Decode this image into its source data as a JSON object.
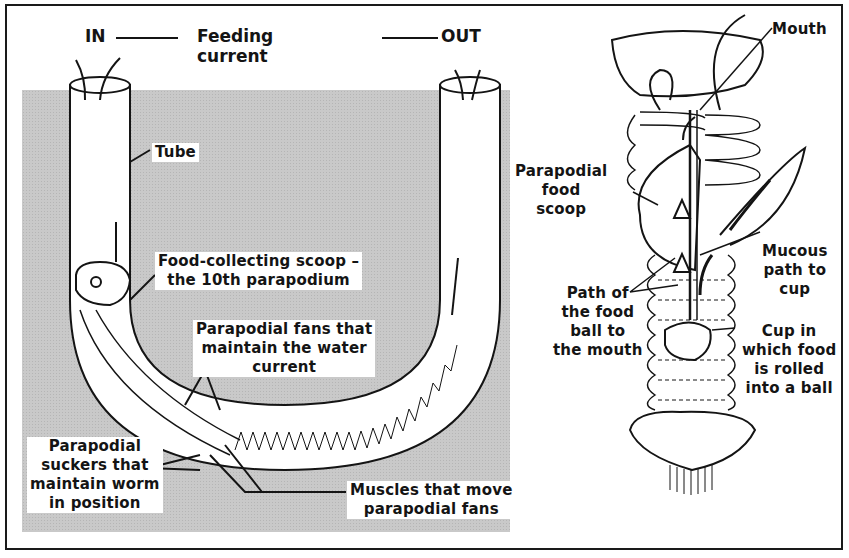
{
  "diagram": {
    "title_row": {
      "in_label": "IN",
      "center_label": "Feeding current",
      "out_label": "OUT"
    },
    "left_panel": {
      "subject": "U-shaped tube with worm",
      "labels": {
        "tube": "Tube",
        "scoop_line1": "Food-collecting scoop –",
        "scoop_line2": "the 10th parapodium",
        "fans_line1": "Parapodial fans that",
        "fans_line2": "maintain the water",
        "fans_line3": "current",
        "suckers_line1": "Parapodial",
        "suckers_line2": "suckers that",
        "suckers_line3": "maintain worm",
        "suckers_line4": "in position",
        "muscles_line1": "Muscles that move",
        "muscles_line2": "parapodial fans"
      }
    },
    "right_panel": {
      "subject": "Anterior end of worm (feeding apparatus)",
      "labels": {
        "mouth": "Mouth",
        "scoop_line1": "Parapodial",
        "scoop_line2": "food",
        "scoop_line3": "scoop",
        "mucous_line1": "Mucous",
        "mucous_line2": "path to",
        "mucous_line3": "cup",
        "path_line1": "Path of",
        "path_line2": "the food",
        "path_line3": "ball to",
        "path_line4": "the mouth",
        "cup_line1": "Cup in",
        "cup_line2": "which food",
        "cup_line3": "is rolled",
        "cup_line4": "into a ball"
      }
    },
    "colors": {
      "ink": "#141414",
      "sediment_gray": "#c9c9c9",
      "paper": "#ffffff"
    }
  }
}
